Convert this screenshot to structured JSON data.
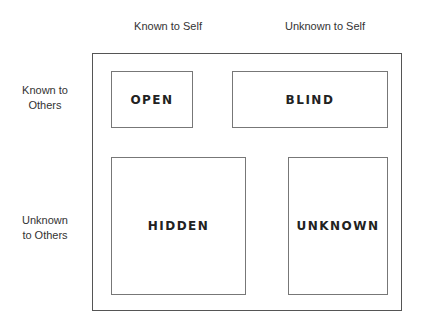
{
  "columns": [
    "Known to Self",
    "Unknown to Self"
  ],
  "rows": [
    "Known to Others",
    "Unknown to Others"
  ],
  "rows_split": [
    [
      "Known to",
      "Others"
    ],
    [
      "Unknown",
      "to Others"
    ]
  ],
  "panes": {
    "open": "OPEN",
    "blind": "BLIND",
    "hidden": "HIDDEN",
    "unknown": "UNKNOWN"
  }
}
